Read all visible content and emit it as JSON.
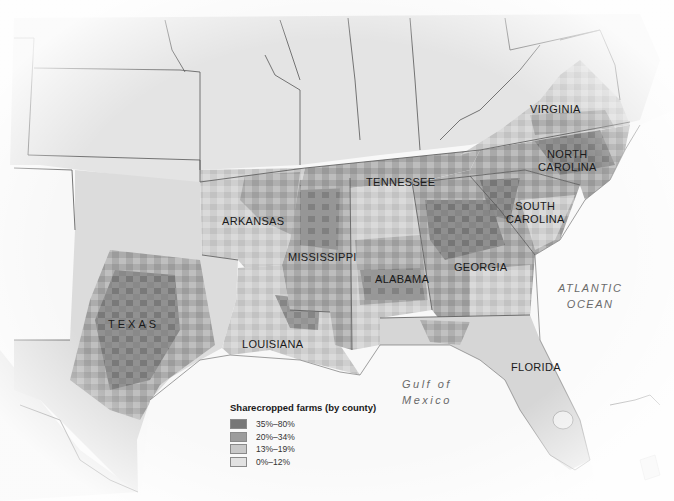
{
  "map": {
    "title": "Sharecropped farms (by county)",
    "colors": {
      "land_other": "#e6e6e6",
      "land_south_light": "#d8d8d8",
      "water": "#fafafa",
      "border": "#555555"
    },
    "states": [
      {
        "name": "VIRGINIA",
        "x": 544,
        "y": 103
      },
      {
        "name": "NORTH\nCAROLINA",
        "line1": "NORTH",
        "line2": "CAROLINA",
        "x": 540,
        "y": 151
      },
      {
        "name": "TENNESSEE",
        "x": 366,
        "y": 176
      },
      {
        "name": "SOUTH\nCAROLINA",
        "line1": "SOUTH",
        "line2": "CAROLINA",
        "x": 508,
        "y": 203
      },
      {
        "name": "ARKANSAS",
        "x": 222,
        "y": 219
      },
      {
        "name": "MISSISSIPPI",
        "x": 288,
        "y": 252
      },
      {
        "name": "ALABAMA",
        "x": 376,
        "y": 273
      },
      {
        "name": "GEORGIA",
        "x": 454,
        "y": 262
      },
      {
        "name": "TEXAS",
        "x": 108,
        "y": 318
      },
      {
        "name": "LOUISIANA",
        "x": 242,
        "y": 338
      },
      {
        "name": "FLORIDA",
        "x": 511,
        "y": 362
      }
    ],
    "water_labels": [
      {
        "name": "ATLANTIC OCEAN",
        "line1": "ATLANTIC",
        "line2": "OCEAN",
        "x": 558,
        "y": 280
      },
      {
        "name": "Gulf of Mexico",
        "line1": "Gulf of",
        "line2": "Mexico",
        "x": 400,
        "y": 374
      }
    ],
    "legend": {
      "title": "Sharecropped farms (by county)",
      "items": [
        {
          "label": "35%–80%",
          "color": "#777777"
        },
        {
          "label": "20%–34%",
          "color": "#9c9c9c"
        },
        {
          "label": "13%–19%",
          "color": "#c9c9c9"
        },
        {
          "label": "0%–12%",
          "color": "#e2e2e2"
        }
      ]
    }
  }
}
